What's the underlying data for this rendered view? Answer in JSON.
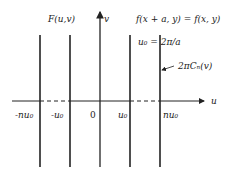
{
  "diagram": {
    "title_left": "F(u,v)",
    "equation_periodicity": "f(x + a, y) = f(x, y)",
    "u0_definition": "u₀ = 2π/a",
    "line_annotation": "2πCₙ(v)",
    "axes": {
      "horizontal_label": "u",
      "vertical_label": "v"
    },
    "tick_labels": [
      "-nu₀",
      "-u₀",
      "0",
      "u₀",
      "nu₀"
    ],
    "spectral_lines_x": [
      40,
      70,
      100,
      130,
      160
    ],
    "colors": {
      "ink": "#222222",
      "background": "#ffffff"
    }
  }
}
